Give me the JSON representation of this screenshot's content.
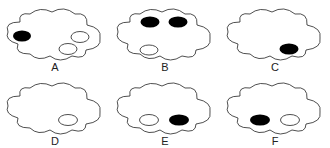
{
  "figure": {
    "colors": {
      "outline": "#222222",
      "filled": "#000000",
      "hollow": "#ffffff"
    },
    "options": [
      {
        "label": "A",
        "ovals": [
          {
            "pos": "left",
            "fill": "black"
          },
          {
            "pos": "right",
            "fill": "white"
          },
          {
            "pos": "bottom-right",
            "fill": "white"
          }
        ]
      },
      {
        "label": "B",
        "ovals": [
          {
            "pos": "top-left",
            "fill": "black"
          },
          {
            "pos": "top-right",
            "fill": "black"
          },
          {
            "pos": "bottom-left",
            "fill": "white"
          }
        ]
      },
      {
        "label": "C",
        "ovals": [
          {
            "pos": "bottom-right",
            "fill": "black"
          }
        ]
      },
      {
        "label": "D",
        "ovals": [
          {
            "pos": "bottom-right",
            "fill": "white"
          }
        ]
      },
      {
        "label": "E",
        "ovals": [
          {
            "pos": "bottom-left",
            "fill": "white"
          },
          {
            "pos": "bottom-right",
            "fill": "black"
          }
        ]
      },
      {
        "label": "F",
        "ovals": [
          {
            "pos": "bottom-left",
            "fill": "black"
          },
          {
            "pos": "bottom-right",
            "fill": "white"
          }
        ]
      }
    ]
  }
}
